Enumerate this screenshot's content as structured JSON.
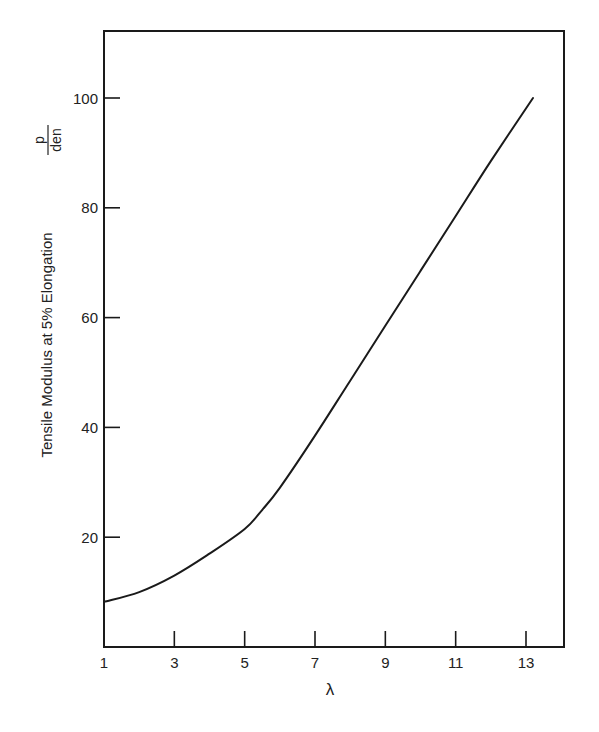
{
  "chart_data": {
    "type": "line",
    "title": "",
    "xlabel": "λ",
    "ylabel": "Tensile Modulus at 5% Elongation",
    "yunit_numerator": "p",
    "yunit_denominator": "den",
    "xlim": [
      1,
      14
    ],
    "ylim": [
      0,
      112
    ],
    "x_ticks": [
      1,
      3,
      5,
      7,
      9,
      11,
      13
    ],
    "y_ticks": [
      20,
      40,
      60,
      80,
      100
    ],
    "grid": false,
    "legend": null,
    "series": [
      {
        "name": "Tensile modulus vs draw ratio",
        "x": [
          1,
          2,
          3,
          4,
          5,
          5.5,
          6,
          7,
          8,
          9,
          10,
          11,
          12,
          13.2
        ],
        "y": [
          8.2,
          10,
          13,
          17,
          21.5,
          25,
          29,
          38.5,
          48.5,
          58.5,
          68.5,
          78.5,
          88.5,
          100
        ]
      }
    ]
  },
  "axes": {
    "x_tick_labels": [
      "1",
      "3",
      "5",
      "7",
      "9",
      "11",
      "13"
    ],
    "y_tick_labels": [
      "20",
      "40",
      "60",
      "80",
      "100"
    ],
    "xlabel": "λ",
    "ylabel": "Tensile Modulus at 5% Elongation",
    "unit_num": "p",
    "unit_den": "den"
  },
  "style": {
    "line_color": "#1a1a1a",
    "frame_color": "#1a1a1a",
    "background": "#ffffff"
  }
}
